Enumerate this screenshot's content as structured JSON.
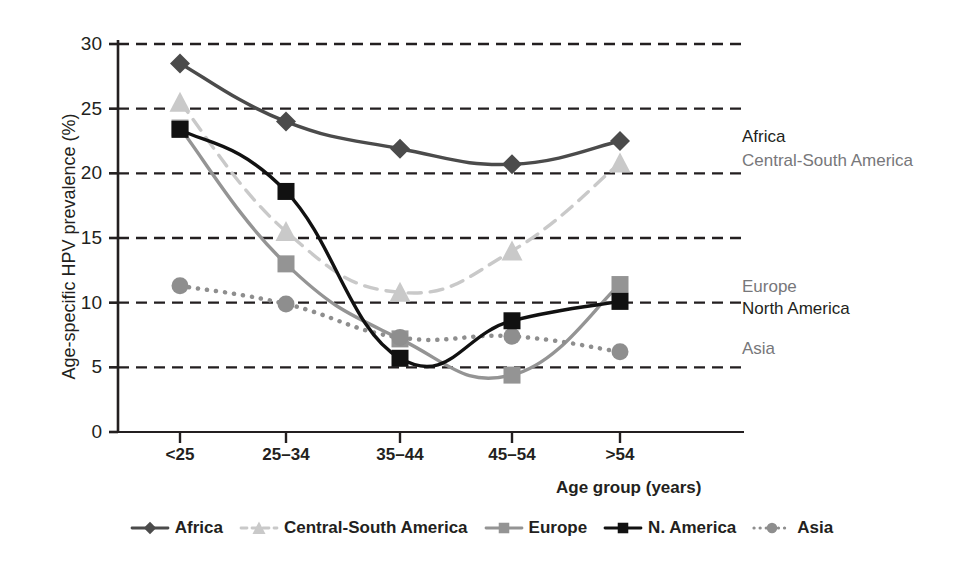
{
  "chart_data": {
    "type": "line",
    "title": "",
    "xlabel": "Age group (years)",
    "ylabel": "Age-specific HPV prevalence (%)",
    "categories": [
      "<25",
      "25–34",
      "35–44",
      "45–54",
      ">54"
    ],
    "ylim": [
      0,
      30
    ],
    "yticks": [
      0,
      5,
      10,
      15,
      20,
      25,
      30
    ],
    "grid": "horizontal-dashed",
    "legend_position": "bottom",
    "series": [
      {
        "name": "Africa",
        "legend_label": "Africa",
        "inline_label": "Africa",
        "values": [
          28.5,
          24.0,
          21.9,
          20.7,
          22.5
        ],
        "color": "#4b4b4b",
        "marker": "diamond",
        "linestyle": "solid",
        "label_color": "#231f20"
      },
      {
        "name": "Central-South America",
        "legend_label": "Central-South America",
        "inline_label": "Central-South America",
        "values": [
          25.5,
          15.5,
          10.8,
          14.0,
          20.8
        ],
        "color": "#c9c9c9",
        "marker": "triangle",
        "linestyle": "dashed",
        "label_color": "#77777a"
      },
      {
        "name": "Europe",
        "legend_label": "Europe",
        "inline_label": "Europe",
        "values": [
          23.5,
          13.0,
          7.2,
          4.4,
          11.4
        ],
        "color": "#949494",
        "marker": "square",
        "linestyle": "solid",
        "label_color": "#77777a"
      },
      {
        "name": "N. America",
        "legend_label": "N. America",
        "inline_label": "North America",
        "values": [
          23.4,
          18.6,
          5.7,
          8.6,
          10.1
        ],
        "color": "#111111",
        "marker": "square",
        "linestyle": "solid",
        "label_color": "#231f20"
      },
      {
        "name": "Asia",
        "legend_label": "Asia",
        "inline_label": "Asia",
        "values": [
          11.3,
          9.9,
          7.3,
          7.4,
          6.2
        ],
        "color": "#8e8e8e",
        "marker": "circle",
        "linestyle": "dotted",
        "label_color": "#77777a"
      }
    ]
  },
  "colors": {
    "axis": "#231f20",
    "gridline": "#231f20",
    "background": "#ffffff"
  }
}
